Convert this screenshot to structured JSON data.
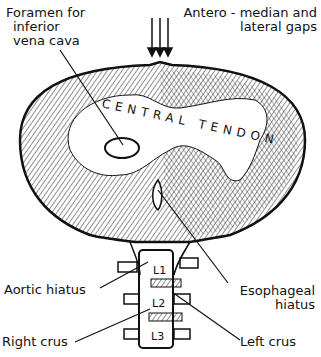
{
  "diagram": {
    "labels": {
      "foramen_ivc": [
        "Foramen for",
        "inferior",
        "vena cava"
      ],
      "antero_median": [
        "Antero - median and",
        "lateral gaps"
      ],
      "central_tendon": "CENTRAL TENDON",
      "aortic_hiatus": "Aortic hiatus",
      "esophageal_hiatus": [
        "Esophageal",
        "hiatus"
      ],
      "right_crus": "Right crus",
      "left_crus": "Left crus"
    },
    "vertebrae": [
      "L1",
      "L2",
      "L3"
    ]
  }
}
